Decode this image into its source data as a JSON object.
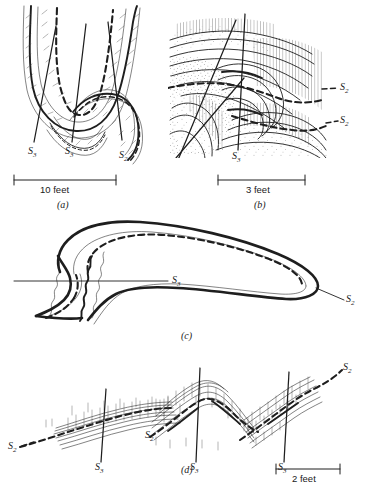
{
  "figure": {
    "kind": "structural-geology-fold-diagram",
    "background_color": "#ffffff",
    "ink_color": "#1a1a1a",
    "panels": [
      {
        "id": "a",
        "caption": "(a)",
        "scale_label": "10 feet",
        "axial_trace_labels": [
          "S3",
          "S3",
          "S2"
        ]
      },
      {
        "id": "b",
        "caption": "(b)",
        "scale_label": "3 feet",
        "axial_trace_labels": [
          "S3",
          "S2",
          "S2"
        ]
      },
      {
        "id": "c",
        "caption": "(c)",
        "scale_label": "",
        "axial_trace_labels": [
          "S3",
          "S2"
        ]
      },
      {
        "id": "d",
        "caption": "(d)",
        "scale_label": "2 feet",
        "axial_trace_labels": [
          "S2",
          "S3",
          "S2",
          "S3",
          "S3",
          "S2"
        ]
      }
    ]
  },
  "labels": {
    "panel_a": {
      "s3_left": {
        "base": "S",
        "sub": "3"
      },
      "s3_mid": {
        "base": "S",
        "sub": "3"
      },
      "s2_right": {
        "base": "S",
        "sub": "2"
      },
      "scale": "10 feet",
      "caption": "(a)"
    },
    "panel_b": {
      "s3_bottom": {
        "base": "S",
        "sub": "3"
      },
      "s2_upper": {
        "base": "S",
        "sub": "2"
      },
      "s2_lower": {
        "base": "S",
        "sub": "2"
      },
      "scale": "3 feet",
      "caption": "(b)"
    },
    "panel_c": {
      "s3_left": {
        "base": "S",
        "sub": "3"
      },
      "s2_right": {
        "base": "S",
        "sub": "2"
      },
      "caption": "(c)"
    },
    "panel_d": {
      "s2_far_left": {
        "base": "S",
        "sub": "2"
      },
      "s3_first": {
        "base": "S",
        "sub": "3"
      },
      "s2_second": {
        "base": "S",
        "sub": "2"
      },
      "s3_second": {
        "base": "S",
        "sub": "3"
      },
      "s3_third": {
        "base": "S",
        "sub": "3"
      },
      "s2_far_right": {
        "base": "S",
        "sub": "2"
      },
      "scale": "2 feet",
      "caption": "(d)"
    }
  }
}
